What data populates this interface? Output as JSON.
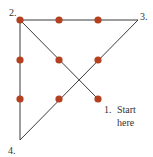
{
  "diagram": {
    "type": "nine-dot-puzzle-solution",
    "dot_color": "#b5401f",
    "line_color": "#3a3a3a",
    "dots": [
      {
        "x": 20,
        "y": 20
      },
      {
        "x": 59,
        "y": 20
      },
      {
        "x": 98,
        "y": 20
      },
      {
        "x": 20,
        "y": 60
      },
      {
        "x": 59,
        "y": 60
      },
      {
        "x": 98,
        "y": 60
      },
      {
        "x": 20,
        "y": 99
      },
      {
        "x": 59,
        "y": 99
      },
      {
        "x": 98,
        "y": 99
      }
    ],
    "path": [
      {
        "x": 98,
        "y": 99
      },
      {
        "x": 20,
        "y": 20
      },
      {
        "x": 138,
        "y": 20
      },
      {
        "x": 20,
        "y": 140
      },
      {
        "x": 20,
        "y": 20
      }
    ],
    "labels": {
      "step1_num": "1.",
      "step1_text_line1": "Start",
      "step1_text_line2": "here",
      "step2": "2.",
      "step3": "3.",
      "step4": "4."
    }
  }
}
